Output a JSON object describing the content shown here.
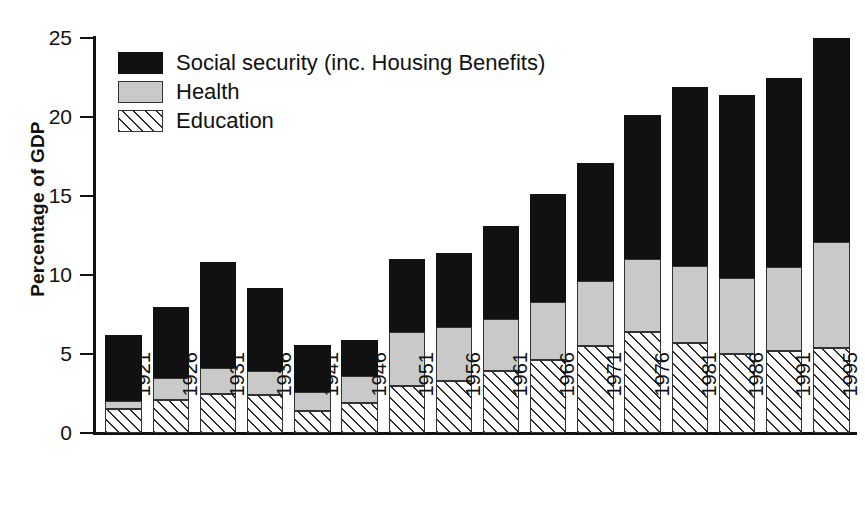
{
  "chart_data": {
    "type": "bar",
    "subtype": "stacked-vertical",
    "title": "",
    "xlabel": "",
    "ylabel": "Percentage of GDP",
    "ylim": [
      0,
      25
    ],
    "yticks": [
      0,
      5,
      10,
      15,
      20,
      25
    ],
    "grid": false,
    "legend_position": "top-left",
    "categories": [
      "1921",
      "1926",
      "1931",
      "1936",
      "1941",
      "1946",
      "1951",
      "1956",
      "1961",
      "1966",
      "1971",
      "1976",
      "1981",
      "1986",
      "1991",
      "1995"
    ],
    "series": [
      {
        "name": "Education",
        "key": "education",
        "swatch": "hatched-diagonal",
        "color": "#ffffff",
        "values": [
          1.5,
          2.1,
          2.5,
          2.4,
          1.4,
          1.9,
          3.0,
          3.3,
          3.9,
          4.6,
          5.5,
          6.4,
          5.7,
          5.0,
          5.2,
          5.4
        ]
      },
      {
        "name": "Health",
        "key": "health",
        "swatch": "solid-gray",
        "color": "#c9c9c9",
        "values": [
          0.5,
          1.4,
          1.6,
          1.5,
          1.2,
          1.7,
          3.4,
          3.4,
          3.3,
          3.7,
          4.1,
          4.6,
          4.9,
          4.8,
          5.3,
          6.7
        ]
      },
      {
        "name": "Social security (inc. Housing Benefits)",
        "key": "social_security",
        "swatch": "solid-black",
        "color": "#111111",
        "values": [
          4.2,
          4.5,
          6.7,
          5.3,
          3.0,
          2.3,
          4.6,
          4.7,
          5.9,
          6.8,
          7.5,
          9.1,
          11.3,
          11.6,
          12.0,
          12.9
        ]
      }
    ],
    "totals": [
      6.2,
      8.0,
      10.8,
      9.2,
      5.6,
      5.9,
      11.0,
      11.4,
      13.1,
      15.1,
      17.1,
      20.1,
      21.9,
      21.4,
      22.5,
      25.0
    ]
  },
  "legend": {
    "items": [
      {
        "label": "Social security (inc. Housing Benefits)",
        "key": "social_security"
      },
      {
        "label": "Health",
        "key": "health"
      },
      {
        "label": "Education",
        "key": "education"
      }
    ]
  },
  "caption": {
    "text": ""
  }
}
